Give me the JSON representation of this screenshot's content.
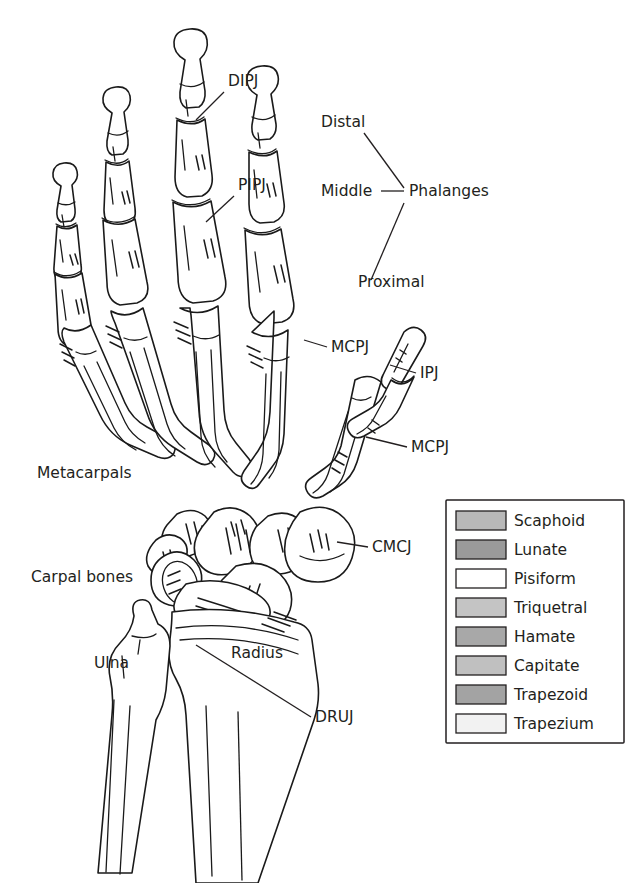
{
  "figure": {
    "type": "anatomical-diagram",
    "background_color": "#ffffff",
    "line_color": "#1a1a1a",
    "text_color": "#231f20"
  },
  "annotations": [
    {
      "id": "dipj",
      "text": "DIPJ",
      "x": 228,
      "y": 86,
      "anchor": "start"
    },
    {
      "id": "pipj",
      "text": "PIPJ",
      "x": 238,
      "y": 190,
      "anchor": "start"
    },
    {
      "id": "distal",
      "text": "Distal",
      "x": 321,
      "y": 127,
      "anchor": "start"
    },
    {
      "id": "middle",
      "text": "Middle",
      "x": 321,
      "y": 196,
      "anchor": "start"
    },
    {
      "id": "phalanges",
      "text": "Phalanges",
      "x": 409,
      "y": 196,
      "anchor": "start"
    },
    {
      "id": "proximal",
      "text": "Proximal",
      "x": 358,
      "y": 287,
      "anchor": "start"
    },
    {
      "id": "mcpj-index",
      "text": "MCPJ",
      "x": 331,
      "y": 352,
      "anchor": "start"
    },
    {
      "id": "ipj",
      "text": "IPJ",
      "x": 420,
      "y": 378,
      "anchor": "start"
    },
    {
      "id": "mcpj-thumb",
      "text": "MCPJ",
      "x": 411,
      "y": 452,
      "anchor": "start"
    },
    {
      "id": "metacarpals",
      "text": "Metacarpals",
      "x": 37,
      "y": 478,
      "anchor": "start"
    },
    {
      "id": "cmcj",
      "text": "CMCJ",
      "x": 372,
      "y": 552,
      "anchor": "start"
    },
    {
      "id": "carpal-bones",
      "text": "Carpal bones",
      "x": 31,
      "y": 582,
      "anchor": "start"
    },
    {
      "id": "radius",
      "text": "Radius",
      "x": 231,
      "y": 658,
      "anchor": "start"
    },
    {
      "id": "ulna",
      "text": "Ulna",
      "x": 94,
      "y": 668,
      "anchor": "start"
    },
    {
      "id": "druj",
      "text": "DRUJ",
      "x": 315,
      "y": 722,
      "anchor": "start"
    }
  ],
  "legend": {
    "x": 446,
    "y": 500,
    "width": 178,
    "height": 243,
    "border_color": "#231f20",
    "items": [
      {
        "label": "Scaphoid",
        "color": "#b8b8b8"
      },
      {
        "label": "Lunate",
        "color": "#9a9a9a"
      },
      {
        "label": "Pisiform",
        "color": "#ffffff"
      },
      {
        "label": "Triquetral",
        "color": "#c4c4c4"
      },
      {
        "label": "Hamate",
        "color": "#a8a8a8"
      },
      {
        "label": "Capitate",
        "color": "#c0c0c0"
      },
      {
        "label": "Trapezoid",
        "color": "#a3a3a3"
      },
      {
        "label": "Trapezium",
        "color": "#f2f2f2"
      }
    ]
  },
  "carpal_fills": {
    "scaphoid": "#b8b8b8",
    "lunate": "#9a9a9a",
    "pisiform": "#ffffff",
    "triquetral": "#c4c4c4",
    "hamate": "#a8a8a8",
    "capitate": "#c0c0c0",
    "trapezoid": "#a3a3a3",
    "trapezium": "#f2f2f2"
  }
}
